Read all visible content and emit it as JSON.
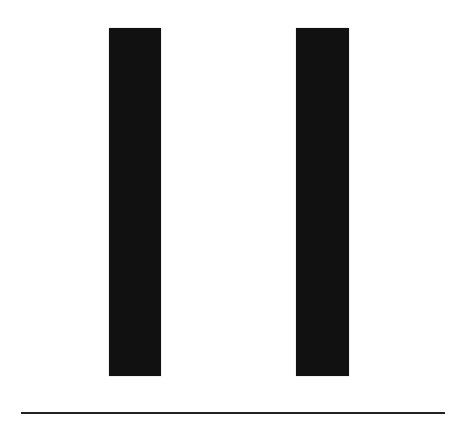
{
  "illustration": {
    "description": "Two vertical black bars above a horizontal line",
    "icon": "pause-icon",
    "colors": {
      "background": "#ffffff",
      "bars": "#111111",
      "line": "#222222"
    },
    "bars": [
      {
        "name": "left-bar"
      },
      {
        "name": "right-bar"
      }
    ]
  }
}
